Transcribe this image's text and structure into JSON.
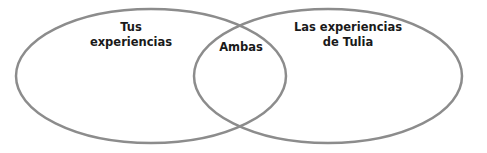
{
  "diagram": {
    "type": "venn",
    "stroke_color": "#8c8c8c",
    "sets": [
      {
        "id": "left",
        "label_lines": [
          "Tus",
          "experiencias"
        ],
        "ellipse": {
          "cx": 151,
          "cy": 76,
          "rx": 135,
          "ry": 67
        }
      },
      {
        "id": "right",
        "label_lines": [
          "Las experiencias",
          "de Tulia"
        ],
        "ellipse": {
          "cx": 328,
          "cy": 76,
          "rx": 134,
          "ry": 67
        }
      }
    ],
    "intersection": {
      "label": "Ambas"
    }
  }
}
